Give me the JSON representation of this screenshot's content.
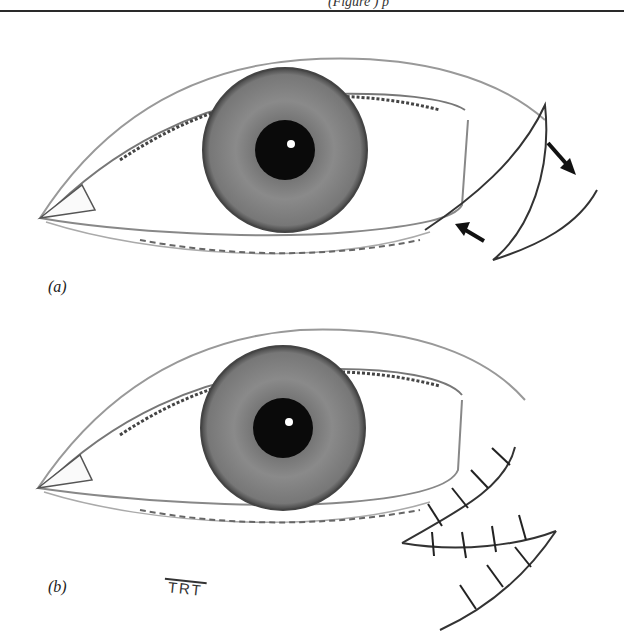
{
  "page": {
    "header_fragment": "(Figure ) p",
    "figure": {
      "panels": [
        {
          "id": "a",
          "label": "(a)",
          "description": "Eye with lateral canthal triangular incision and arrows indicating flap advancement"
        },
        {
          "id": "b",
          "label": "(b)",
          "description": "Eye after closure with interrupted sutures at lateral canthus"
        }
      ],
      "signature": "TRT"
    },
    "colors": {
      "ink": "#222222",
      "iris": "#7a7a7a",
      "pupil": "#0a0a0a",
      "skin_shade": "#d8d8d8"
    }
  }
}
